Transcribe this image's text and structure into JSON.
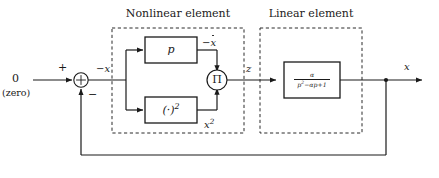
{
  "diagram": {
    "groups": {
      "nonlinear": {
        "title": "Nonlinear element"
      },
      "linear": {
        "title": "Linear element"
      }
    },
    "source": {
      "value": "0",
      "caption": "(zero)"
    },
    "summing_junction": {
      "glyph": "⊕",
      "plus_sign": "+",
      "minus_sign": "−"
    },
    "multiplier": {
      "glyph": "Π"
    },
    "blocks": {
      "derivative": {
        "label": "p"
      },
      "square": {
        "label": "(·)",
        "exponent": "2"
      },
      "transfer": {
        "numerator": "α",
        "denominator_p": "p",
        "denominator_p_exp": "2",
        "denominator_rest": "−αp+1"
      }
    },
    "signals": {
      "error": "−x",
      "derivative_out_prefix": "−",
      "derivative_out_var": "x",
      "square_out": "x",
      "square_out_exp": "2",
      "product": "z",
      "output": "x"
    },
    "colors": {
      "line": "#1a1a1a",
      "dashed": "#2a2a2a",
      "background": "#ffffff",
      "text": "#1a1a1a"
    }
  }
}
